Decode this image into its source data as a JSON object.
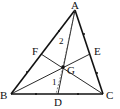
{
  "figure": {
    "type": "triangle-medians",
    "points": {
      "A": {
        "label": "A",
        "x": 75,
        "y": 10
      },
      "B": {
        "label": "B",
        "x": 11,
        "y": 94
      },
      "C": {
        "label": "C",
        "x": 103,
        "y": 94
      },
      "D": {
        "label": "D",
        "x": 58,
        "y": 94
      },
      "E": {
        "label": "E",
        "x": 90,
        "y": 54
      },
      "F": {
        "label": "F",
        "x": 41,
        "y": 54
      },
      "G": {
        "label": "G",
        "x": 63,
        "y": 67
      }
    },
    "angle_labels": {
      "one": "1",
      "two": "2"
    },
    "colors": {
      "stroke": "#111111",
      "background": "#ffffff"
    }
  }
}
